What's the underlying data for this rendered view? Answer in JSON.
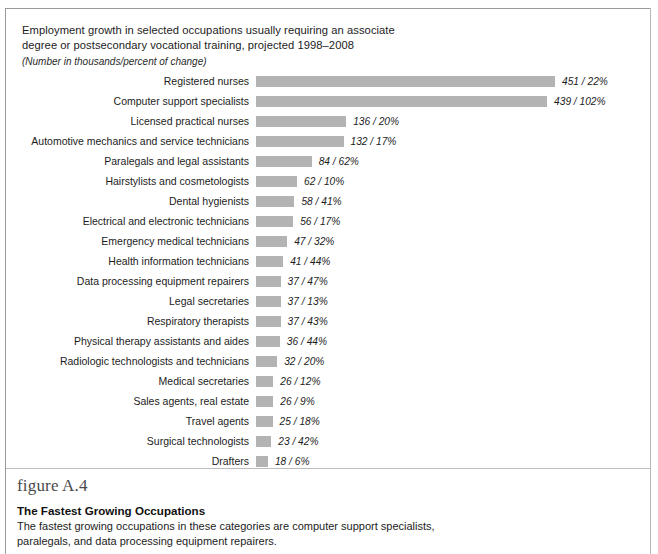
{
  "figure": {
    "number_label": "figure A.4",
    "caption_title": "The Fastest Growing Occupations",
    "caption_line1": "The fastest growing occupations in these categories are computer support specialists,",
    "caption_line2": "paralegals, and data processing equipment repairers."
  },
  "chart_data": {
    "type": "bar",
    "orientation": "horizontal",
    "title_line1": "Employment growth in selected occupations usually requiring an associate",
    "title_line2": "degree or postsecondary vocational training, projected 1998–2008",
    "subtitle": "(Number in thousands/percent of change)",
    "xlabel": "",
    "ylabel": "",
    "grid": false,
    "legend": "none",
    "value_format": "{number} / {percent}%",
    "xlim": [
      0,
      460
    ],
    "bar_color": "#b3b3b3",
    "categories": [
      "Registered nurses",
      "Computer support specialists",
      "Licensed practical nurses",
      "Automotive mechanics and service technicians",
      "Paralegals and legal assistants",
      "Hairstylists and cosmetologists",
      "Dental hygienists",
      "Electrical and electronic technicians",
      "Emergency medical technicians",
      "Health information technicians",
      "Data processing equipment repairers",
      "Legal secretaries",
      "Respiratory therapists",
      "Physical therapy assistants and aides",
      "Radiologic technologists and technicians",
      "Medical secretaries",
      "Sales agents, real estate",
      "Travel agents",
      "Surgical technologists",
      "Drafters"
    ],
    "values": [
      451,
      439,
      136,
      132,
      84,
      62,
      58,
      56,
      47,
      41,
      37,
      37,
      37,
      36,
      32,
      26,
      26,
      25,
      23,
      18
    ],
    "percent_change": [
      22,
      102,
      20,
      17,
      62,
      10,
      41,
      17,
      32,
      44,
      47,
      13,
      43,
      44,
      20,
      12,
      9,
      18,
      42,
      6
    ],
    "value_labels": [
      "451 / 22%",
      "439 / 102%",
      "136 / 20%",
      "132 / 17%",
      "84 / 62%",
      "62 / 10%",
      "58 / 41%",
      "56 / 17%",
      "47 / 32%",
      "41 / 44%",
      "37 / 47%",
      "37 / 13%",
      "37 / 43%",
      "36 / 44%",
      "32 / 20%",
      "26 / 12%",
      "26 / 9%",
      "25 / 18%",
      "23 / 42%",
      "18 / 6%"
    ]
  }
}
